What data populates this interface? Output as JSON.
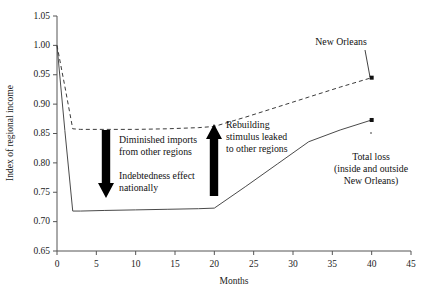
{
  "chart_data": {
    "type": "line",
    "title": "",
    "xlabel": "Months",
    "ylabel": "Index of regional income",
    "xlim": [
      0,
      45
    ],
    "ylim": [
      0.65,
      1.05
    ],
    "xticks": [
      0,
      5,
      10,
      15,
      20,
      25,
      30,
      35,
      40,
      45
    ],
    "xtick_labels": [
      "0",
      "5",
      "10",
      "15",
      "20",
      "25",
      "30",
      "35",
      "40",
      "45"
    ],
    "yticks": [
      0.65,
      0.7,
      0.75,
      0.8,
      0.85,
      0.9,
      0.95,
      1.0,
      1.05
    ],
    "ytick_labels": [
      "0.65",
      "0.70",
      "0.75",
      "0.80",
      "0.85",
      "0.90",
      "0.95",
      "1.00",
      "1.05"
    ],
    "grid": false,
    "legend": "none (direct labels with leader lines)",
    "series": [
      {
        "name": "New Orleans",
        "style": "dashed",
        "color": "#3a3a3a",
        "x": [
          0,
          1,
          2,
          3,
          6,
          10,
          14,
          18,
          20,
          24,
          28,
          32,
          36,
          40
        ],
        "y": [
          1.0,
          0.93,
          0.858,
          0.857,
          0.857,
          0.857,
          0.858,
          0.86,
          0.862,
          0.878,
          0.895,
          0.912,
          0.929,
          0.945
        ],
        "endpoint_marker": true
      },
      {
        "name": "Total loss (inside and outside New Orleans)",
        "style": "solid",
        "color": "#4a4a4a",
        "x": [
          0,
          1,
          2,
          3,
          6,
          10,
          14,
          18,
          20,
          24,
          28,
          32,
          36,
          40
        ],
        "y": [
          1.0,
          0.855,
          0.718,
          0.718,
          0.719,
          0.72,
          0.721,
          0.722,
          0.723,
          0.76,
          0.798,
          0.836,
          0.856,
          0.873
        ],
        "endpoint_marker": true
      }
    ],
    "annotations": [
      {
        "name": "new-orleans-label",
        "text": "New Orleans",
        "x_px": 341,
        "y_px": 45,
        "leader_to_px": [
          370,
          77
        ]
      },
      {
        "name": "total-loss-label",
        "lines": [
          "Total loss",
          "(inside and outside",
          "New Orleans)"
        ],
        "x_px": 371,
        "y_px": 160,
        "leader_to_px": [
          371,
          132
        ]
      },
      {
        "name": "diminished-imports-label",
        "lines": [
          "Diminished imports",
          "from other regions"
        ],
        "x_px": 119,
        "y_px": 143
      },
      {
        "name": "indebtedness-label",
        "lines": [
          "Indebtedness effect",
          "nationally"
        ],
        "x_px": 119,
        "y_px": 179
      },
      {
        "name": "rebuilding-stimulus-label",
        "lines": [
          "Rebuilding",
          "stimulus leaked",
          "to other regions"
        ],
        "x_px": 226,
        "y_px": 128
      },
      {
        "name": "down-arrow",
        "direction": "down",
        "meaning": "Diminished imports / indebtedness effect",
        "x_px": 106,
        "y_top_px": 130,
        "y_bottom_px": 198
      },
      {
        "name": "up-arrow",
        "direction": "up",
        "meaning": "Rebuilding stimulus leaked to other regions",
        "x_px": 214,
        "y_top_px": 124,
        "y_bottom_px": 196
      }
    ]
  },
  "colors": {
    "background": "#ffffff",
    "axis": "#555555",
    "text": "#111111",
    "solid_series": "#4a4a4a",
    "dashed_series": "#3a3a3a",
    "arrow": "#000000"
  }
}
